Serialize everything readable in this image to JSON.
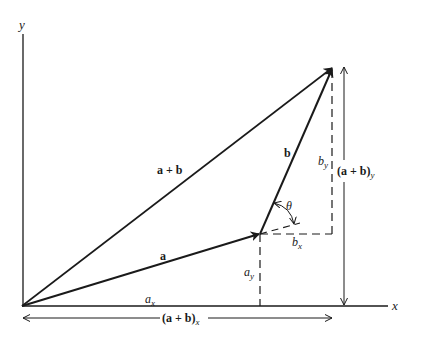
{
  "diagram": {
    "axes": {
      "x_label": "x",
      "y_label": "y"
    },
    "vectors": {
      "a": {
        "label": "a"
      },
      "b": {
        "label": "b"
      },
      "sum": {
        "label": "a + b"
      }
    },
    "components": {
      "a_x": {
        "base": "a",
        "sub": "x"
      },
      "a_y": {
        "base": "a",
        "sub": "y"
      },
      "b_x": {
        "base": "b",
        "sub": "x"
      },
      "b_y": {
        "base": "b",
        "sub": "y"
      },
      "sum_x": {
        "base": "(a + b)",
        "sub": "x"
      },
      "sum_y": {
        "base": "(a + b)",
        "sub": "y"
      }
    },
    "angle": {
      "label": "θ"
    },
    "colors": {
      "ink": "#1a1a1a",
      "background": "#ffffff"
    }
  }
}
